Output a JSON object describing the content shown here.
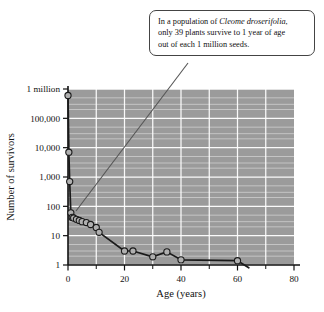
{
  "callout": {
    "lines": [
      "In a population of ",
      "only 39 plants survive to 1 year of age",
      "out of each 1 million seeds."
    ],
    "species": "Cleome droserifolia",
    "species_trailing": ",",
    "border_color": "#444444",
    "background": "#ffffff"
  },
  "chart_data": {
    "type": "line",
    "title": "",
    "xlabel": "Age (years)",
    "ylabel": "Number of survivors",
    "xlim": [
      0,
      80
    ],
    "ylim": [
      1,
      1000000
    ],
    "yscale": "log",
    "grid": true,
    "legend": null,
    "plot_background": "#9b9b9b",
    "gridline_color": "#ffffff",
    "line_color": "#1a1a1a",
    "marker_fill": "#b0b0b0",
    "marker_edge": "#1a1a1a",
    "xticks": [
      0,
      20,
      40,
      60,
      80
    ],
    "xticklabels": [
      "0",
      "20",
      "40",
      "60",
      "80"
    ],
    "xminorticks": [
      10,
      30,
      50,
      70
    ],
    "yticks": [
      1,
      10,
      100,
      1000,
      10000,
      100000,
      1000000
    ],
    "yticklabels": [
      "1",
      "10",
      "100",
      "1,000",
      "10,000",
      "100,000",
      "1 million"
    ],
    "x": [
      0.0,
      0.3,
      0.6,
      1.0,
      1.5,
      2.0,
      3.0,
      4.0,
      5.0,
      6.5,
      8.0,
      10.0,
      11.0,
      20.0,
      23.0,
      30.0,
      35.0,
      40.0,
      60.0,
      64.0
    ],
    "y": [
      600000,
      7000,
      700,
      60,
      42,
      40,
      36,
      33,
      30,
      28,
      24,
      19,
      13,
      3.0,
      3.0,
      1.9,
      2.8,
      1.5,
      1.4,
      0.8
    ],
    "marker_indices": [
      0,
      1,
      2,
      3,
      4,
      5,
      6,
      7,
      8,
      9,
      10,
      11,
      12,
      13,
      14,
      15,
      16,
      17,
      18
    ],
    "annotation_point": {
      "x": 1.0,
      "y": 39,
      "label": "39 survivors at 1 year"
    }
  },
  "leader": {
    "from": {
      "x": 188,
      "y": 63
    },
    "to": {
      "x": 76,
      "y": 211
    },
    "color": "#555555"
  }
}
